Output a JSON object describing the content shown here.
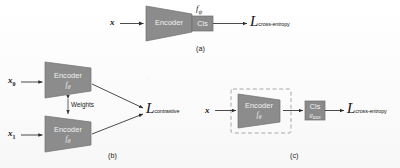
{
  "figure": {
    "kind": "neural-network-training-schematic",
    "panels": [
      {
        "id": "a",
        "label": "(a)",
        "input": "x",
        "encoder": {
          "title": "Encoder",
          "param": ""
        },
        "classifier": {
          "title": "Cls",
          "param_above": "f",
          "param_above_sub": "ψ"
        },
        "loss": {
          "symbol": "L",
          "subscript": "cross-entropy"
        }
      },
      {
        "id": "b",
        "label": "(b)",
        "inputs": [
          {
            "base": "x",
            "sub": "0"
          },
          {
            "base": "x",
            "sub": "1"
          }
        ],
        "encoders": [
          {
            "title": "Encoder",
            "param": "f",
            "param_sub": "θ"
          },
          {
            "title": "Encoder",
            "param": "f",
            "param_sub": "θ"
          }
        ],
        "link_label": "Weights",
        "loss": {
          "symbol": "L",
          "subscript": "contrastive"
        }
      },
      {
        "id": "c",
        "label": "(c)",
        "input": "x",
        "frozen_box": {
          "style": "dashed"
        },
        "encoder": {
          "title": "Encoder",
          "param": "f",
          "param_sub": "θ"
        },
        "classifier": {
          "title": "Cls",
          "param": "g",
          "param_sub": "aux"
        },
        "loss": {
          "symbol": "L",
          "subscript": "cross-entropy"
        }
      }
    ]
  },
  "colors": {
    "block_fill": "#8c8c8c",
    "block_stroke": "#6e6e6e",
    "cls_fill": "#8a8a8a",
    "arrow": "#2b2b2b",
    "dashed_border": "#a0a0a0",
    "background": "#fdfdfd",
    "text_dark": "#181818",
    "text_light": "#f2f2f2"
  }
}
